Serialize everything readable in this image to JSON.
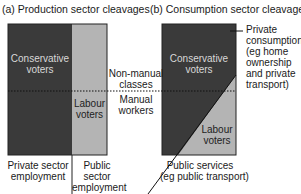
{
  "panel_a": {
    "title": "(a) Production sector cleavages",
    "regions": {
      "conservative": {
        "label_line1": "Conservative",
        "label_line2": "voters"
      },
      "labour": {
        "label_line1": "Labour",
        "label_line2": "voters"
      }
    },
    "axis_labels": {
      "private": {
        "line1": "Private sector",
        "line2": "employment"
      },
      "public": {
        "line1": "Public",
        "line2": "sector",
        "line3": "employment"
      }
    }
  },
  "class_divider": {
    "upper": {
      "line1": "Non-manual",
      "line2": "classes"
    },
    "lower": {
      "line1": "Manual",
      "line2": "workers"
    }
  },
  "panel_b": {
    "title": "(b) Consumption sector cleavages",
    "regions": {
      "conservative": {
        "label_line1": "Conservative",
        "label_line2": "voters"
      },
      "labour": {
        "label_line1": "Labour",
        "label_line2": "voters"
      }
    },
    "annotations": {
      "private": {
        "line1": "Private",
        "line2": "consumption",
        "line3": "(eg home",
        "line4": "ownership",
        "line5": "and private",
        "line6": "transport)"
      },
      "public": {
        "line1": "Public services",
        "line2": "(eg public transport)"
      }
    }
  },
  "colors": {
    "dark": "#3a3a3a",
    "light": "#b4b4b4",
    "line": "#111111"
  }
}
